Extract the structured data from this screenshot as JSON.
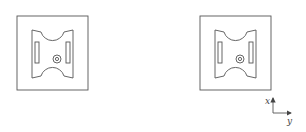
{
  "figure": {
    "panels": [
      {
        "id": "left",
        "label": "part-view-left"
      },
      {
        "id": "right",
        "label": "part-view-right"
      }
    ],
    "axes": {
      "x_label": "x",
      "y_label": "y"
    },
    "colors": {
      "stroke": "#555555",
      "background": "#ffffff"
    }
  }
}
